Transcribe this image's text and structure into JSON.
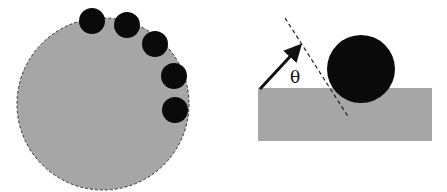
{
  "colors": {
    "background": "#ffffff",
    "gray_body": "#a6a6a6",
    "particle": "#0a0a0a",
    "line": "#222222"
  },
  "left_panel": {
    "large_circle": {
      "cx": 103,
      "cy": 104,
      "r": 86,
      "outline": "dashed"
    },
    "particles": [
      {
        "cx": 92,
        "cy": 21,
        "r": 13
      },
      {
        "cx": 127,
        "cy": 25,
        "r": 13
      },
      {
        "cx": 155,
        "cy": 44,
        "r": 13
      },
      {
        "cx": 174,
        "cy": 76,
        "r": 13
      },
      {
        "cx": 175,
        "cy": 110,
        "r": 13
      }
    ]
  },
  "right_panel": {
    "substrate": {
      "x": 258,
      "y": 88,
      "width": 174,
      "height": 53
    },
    "particle": {
      "cx": 361,
      "cy": 69,
      "r": 34
    },
    "dashed_line": {
      "x1": 285,
      "y1": 18,
      "x2": 349,
      "y2": 118
    },
    "arrow": {
      "x1": 260,
      "y1": 89,
      "x2": 302,
      "y2": 44
    },
    "angle_label": "θ"
  }
}
